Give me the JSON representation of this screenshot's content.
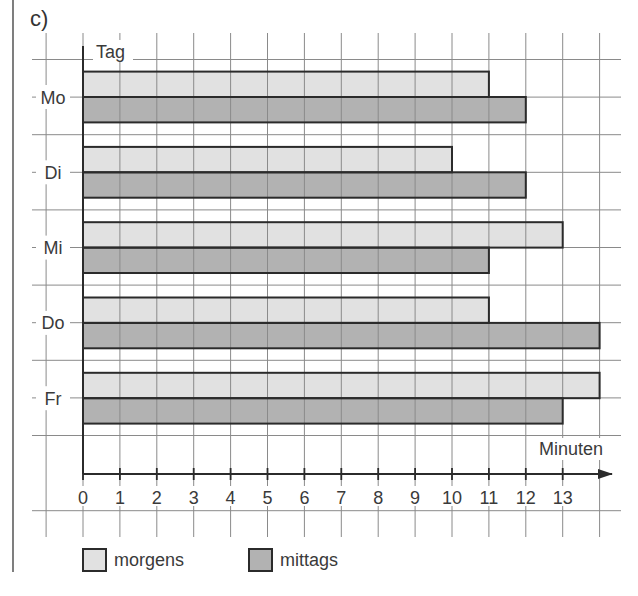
{
  "task_label": "c)",
  "legend": {
    "items": [
      {
        "label": "morgens",
        "color": "#e1e1e1"
      },
      {
        "label": "mittags",
        "color": "#b2b2b2"
      }
    ]
  },
  "colors": {
    "grid": "#8a8a8a",
    "axis": "#2b2b2b",
    "bar_border": "#2b2b2b",
    "morgens": "#e1e1e1",
    "mittags": "#b2b2b2",
    "background": "#ffffff"
  },
  "chart_data": {
    "type": "bar",
    "orientation": "horizontal",
    "title": "",
    "categories": [
      "Mo",
      "Di",
      "Mi",
      "Do",
      "Fr"
    ],
    "series": [
      {
        "name": "morgens",
        "values": [
          11,
          10,
          13,
          11,
          14
        ]
      },
      {
        "name": "mittags",
        "values": [
          12,
          12,
          11,
          14,
          13
        ]
      }
    ],
    "xlabel": "Minuten",
    "ylabel": "Tag",
    "x_ticks": [
      0,
      1,
      2,
      3,
      4,
      5,
      6,
      7,
      8,
      9,
      10,
      11,
      12,
      13
    ],
    "xlim": [
      0,
      14
    ],
    "grid": true,
    "legend_position": "bottom"
  }
}
